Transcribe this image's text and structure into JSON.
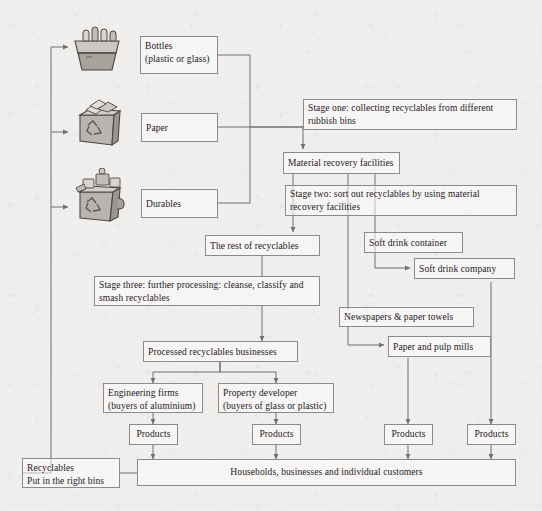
{
  "diagram": {
    "background_color": "#f2f0ee",
    "line_color": "#6f6f6f",
    "box_border_color": "#8b8b8b",
    "text_color": "#24201e"
  },
  "bins": [
    {
      "name": "bottles-bin",
      "alt": "recycling bin full of bottles"
    },
    {
      "name": "paper-bin",
      "alt": "recycling bin full of paper"
    },
    {
      "name": "durables-bin",
      "alt": "recycling bin full of durable goods"
    }
  ],
  "nodes": {
    "bottles": "Bottles\n(plastic or glass)",
    "bottles_line1": "Bottles",
    "bottles_line2": "(plastic or glass)",
    "paper": "Paper",
    "durables": "Durables",
    "stage_one": "Stage one: collecting recyclables from different rubbish bins",
    "material_recovery": "Material recovery facilities",
    "stage_two": "Stage two: sort out recyclables by using material recovery facilities",
    "rest_of_recyclables": "The rest of recyclables",
    "soft_drink_container": "Soft drink container",
    "soft_drink_company": "Soft drink company",
    "stage_three": "Stage three: further processing: cleanse, classify and smash recyclables",
    "newspapers": "Newspapers & paper towels",
    "paper_mills": "Paper and pulp mills",
    "processed_businesses": "Processed recyclables businesses",
    "engineering_line1": "Engineering firms",
    "engineering_line2": "(buyers of aluminium)",
    "property_line1": "Property developer",
    "property_line2": "(buyers of glass or plastic)",
    "products_1": "Products",
    "products_2": "Products",
    "products_3": "Products",
    "products_4": "Products",
    "households": "Households, businesses and individual customers",
    "recyclables_line1": "Recyclables",
    "recyclables_line2": "Put in the right bins"
  }
}
